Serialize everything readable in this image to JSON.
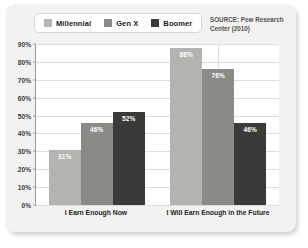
{
  "legend": {
    "entries": [
      {
        "label": "Millennial",
        "color": "#b3b3b0"
      },
      {
        "label": "Gen X",
        "color": "#8a8a86"
      },
      {
        "label": "Boomer",
        "color": "#3a3a38"
      }
    ]
  },
  "source": {
    "text": "SOURCE: Pew Research Center (2010)"
  },
  "axis": {
    "y_ticks": [
      "0%",
      "10%",
      "20%",
      "30%",
      "40%",
      "50%",
      "60%",
      "70%",
      "80%",
      "90%"
    ]
  },
  "bar_labels": {
    "g0s0": "31%",
    "g0s1": "46%",
    "g0s2": "52%",
    "g1s0": "88%",
    "g1s1": "76%",
    "g1s2": "46%"
  },
  "categories_display": {
    "c0": "I Earn Enough Now",
    "c1": "I Will Earn Enough in the Future"
  },
  "chart_data": {
    "type": "bar",
    "title": "",
    "subtitle": "",
    "xlabel": "",
    "ylabel": "",
    "ylim": [
      0,
      90
    ],
    "ytick_step": 10,
    "grid": true,
    "legend_position": "top-left",
    "annotations": [
      "SOURCE: Pew Research Center (2010)"
    ],
    "categories": [
      "I Earn Enough Now",
      "I Will Earn Enough in the Future"
    ],
    "series": [
      {
        "name": "Millennial",
        "color": "#b3b3b0",
        "values": [
          31,
          88
        ]
      },
      {
        "name": "Gen X",
        "color": "#8a8a86",
        "values": [
          46,
          76
        ]
      },
      {
        "name": "Boomer",
        "color": "#3a3a38",
        "values": [
          52,
          46
        ]
      }
    ],
    "value_labels": [
      [
        "31%",
        "46%",
        "52%"
      ],
      [
        "88%",
        "76%",
        "46%"
      ]
    ],
    "units": "percent"
  }
}
